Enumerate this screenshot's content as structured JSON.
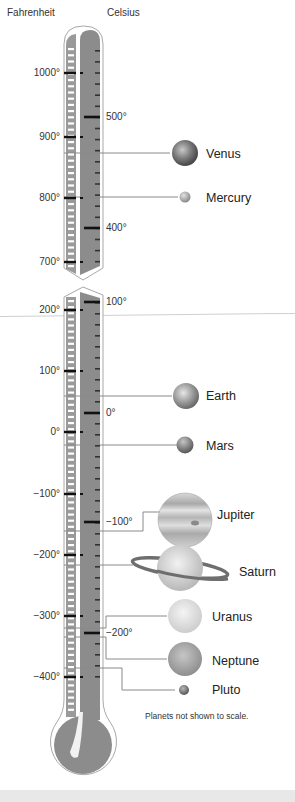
{
  "header": {
    "fahrenheit_label": "Fahrenheit",
    "celsius_label": "Celsius"
  },
  "fahrenheit_ticks": [
    {
      "label": "1000°",
      "y": 73
    },
    {
      "label": "900°",
      "y": 137
    },
    {
      "label": "800°",
      "y": 198
    },
    {
      "label": "700°",
      "y": 262
    },
    {
      "label": "200°",
      "y": 310
    },
    {
      "label": "100°",
      "y": 371
    },
    {
      "label": "0°",
      "y": 432
    },
    {
      "label": "−100°",
      "y": 494
    },
    {
      "label": "−200°",
      "y": 555
    },
    {
      "label": "−300°",
      "y": 616
    },
    {
      "label": "−400°",
      "y": 677
    }
  ],
  "celsius_ticks": [
    {
      "label": "500°",
      "y": 117
    },
    {
      "label": "400°",
      "y": 228
    },
    {
      "label": "100°",
      "y": 302
    },
    {
      "label": "0°",
      "y": 413
    },
    {
      "label": "−100°",
      "y": 522
    },
    {
      "label": "−200°",
      "y": 633
    }
  ],
  "planets": [
    {
      "name": "Venus",
      "line_y": 153,
      "label_y": 148
    },
    {
      "name": "Mercury",
      "line_y": 197,
      "label_y": 192
    },
    {
      "name": "Earth",
      "line_y": 396,
      "label_y": 390
    },
    {
      "name": "Mars",
      "line_y": 445,
      "label_y": 440
    },
    {
      "name": "Jupiter",
      "line_y": 531,
      "label_y": 509
    },
    {
      "name": "Saturn",
      "line_y": 565,
      "label_y": 566
    },
    {
      "name": "Uranus",
      "line_y": 616,
      "label_y": 611
    },
    {
      "name": "Neptune",
      "line_y": 659,
      "label_y": 655
    },
    {
      "name": "Pluto",
      "line_y": 690,
      "label_y": 684
    }
  ],
  "footnote": "Planets not shown to scale.",
  "colors": {
    "mercury_column": "#8c8c8c",
    "fahrenheit_strip": "#9a9a9a",
    "tube_outline": "#a8a8a8",
    "leader_line": "#8a8a8a",
    "bottom_band": "#e8e8e8"
  }
}
